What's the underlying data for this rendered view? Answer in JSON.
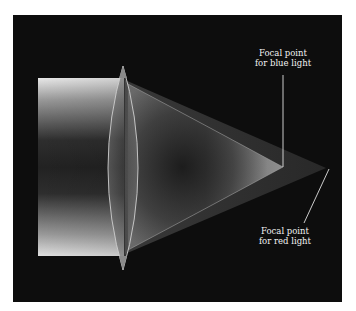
{
  "diagram": {
    "labels": {
      "blue_focal": {
        "line1": "Focal point",
        "line2": "for blue light"
      },
      "red_focal": {
        "line1": "Focal point",
        "line2": "for red light"
      }
    },
    "colors": {
      "background": "#0d0d0d",
      "page": "#ffffff",
      "beam_edge": "#e6e6e6",
      "beam_center": "#2a2a2a",
      "label_text": "#f2f2f2",
      "leader_line": "#e0e0e0"
    },
    "geometry": {
      "beam": {
        "x": 38,
        "y_top": 78,
        "y_bottom": 256
      },
      "lens_tips": {
        "top": [
          123,
          66
        ],
        "bottom": [
          123,
          270
        ]
      },
      "blue_focal_point": [
        283,
        167
      ],
      "red_focal_point": [
        326,
        168
      ]
    }
  }
}
